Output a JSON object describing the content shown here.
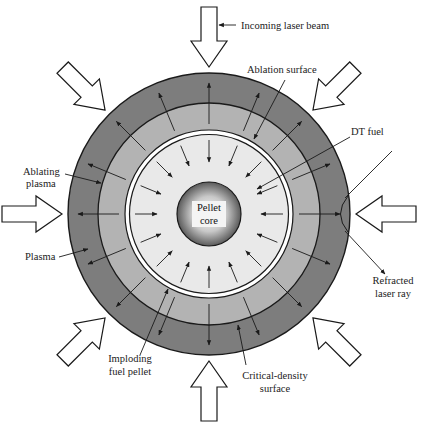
{
  "colors": {
    "plasma": "#7d7d7d",
    "ablating_plasma": "#b3b3b3",
    "dt_fuel": "#e9e9e9",
    "core_light": "#ffffff",
    "core_dark": "#555555",
    "line": "#1a1a1a",
    "beam_fill": "#ffffff"
  },
  "labels": {
    "incoming_laser_beam": "Incoming laser beam",
    "ablation_surface": "Ablation surface",
    "dt_fuel": "DT fuel",
    "ablating_plasma_1": "Ablating",
    "ablating_plasma_2": "plasma",
    "plasma": "Plasma",
    "pellet_core_1": "Pellet",
    "pellet_core_2": "core",
    "refracted_laser_ray_1": "Refracted",
    "refracted_laser_ray_2": "laser ray",
    "imploding_fuel_pellet_1": "Imploding",
    "imploding_fuel_pellet_2": "fuel pellet",
    "critical_density_surface_1": "Critical-density",
    "critical_density_surface_2": "surface"
  },
  "laser_beams": {
    "count": 8,
    "directions_deg": [
      0,
      45,
      90,
      135,
      180,
      225,
      270,
      315
    ]
  },
  "layers": [
    "Plasma",
    "Ablating plasma",
    "DT fuel",
    "Pellet core"
  ],
  "arrows": {
    "inward_count": 16,
    "outward_count": 16
  }
}
